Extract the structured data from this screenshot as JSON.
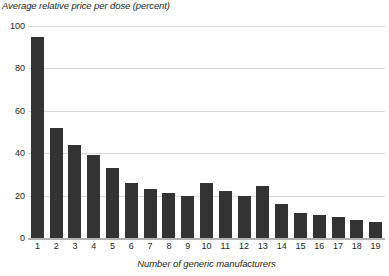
{
  "chart_data": {
    "type": "bar",
    "title": "Average relative price per dose (percent)",
    "xlabel": "Number of generic manufacturers",
    "ylabel": "",
    "categories": [
      "1",
      "2",
      "3",
      "4",
      "5",
      "6",
      "7",
      "8",
      "9",
      "10",
      "11",
      "12",
      "13",
      "14",
      "15",
      "16",
      "17",
      "18",
      "19"
    ],
    "values": [
      95,
      52,
      44,
      39,
      33,
      26,
      23,
      21,
      20,
      26,
      22,
      20,
      24.5,
      16,
      12,
      11,
      10,
      8.5,
      7.5
    ],
    "ylim": [
      0,
      100
    ],
    "yticks": [
      0,
      20,
      40,
      60,
      80,
      100
    ],
    "ytick_labels": [
      "0",
      "20",
      "40",
      "60",
      "80",
      "100"
    ],
    "grid": true,
    "legend": null,
    "bar_color": "#333334",
    "gridline_color": "#d9d9d9",
    "axis_color": "#b0b0b0",
    "text_color": "#231f20"
  }
}
